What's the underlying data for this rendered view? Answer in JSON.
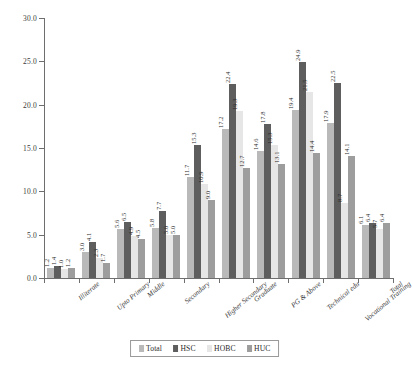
{
  "chart_data": {
    "type": "bar",
    "title": "",
    "xlabel": "",
    "ylabel": "",
    "ylim": [
      0,
      30
    ],
    "ytick_step": 5,
    "grid": false,
    "legend_position": "bottom",
    "yticks": [
      "0.0",
      "5.0",
      "10.0",
      "15.0",
      "20.0",
      "25.0",
      "30.0"
    ],
    "categories": [
      "Illiterate",
      "Upto Primary",
      "Middle",
      "Secondary",
      "Higher Secondary",
      "Graduate",
      "PG & Above",
      "Technical edu",
      "Vocational Training",
      "Total"
    ],
    "series": [
      {
        "name": "Total",
        "color": "#b9b9b9",
        "values": [
          1.2,
          3.0,
          5.6,
          5.8,
          11.7,
          17.2,
          14.6,
          19.4,
          17.9,
          6.1
        ]
      },
      {
        "name": "HSC",
        "color": "#5e5e5e",
        "values": [
          1.4,
          4.1,
          6.5,
          7.7,
          15.3,
          22.4,
          17.8,
          24.9,
          22.5,
          6.4
        ]
      },
      {
        "name": "HOBC",
        "color": "#e6e6e6",
        "values": [
          1.0,
          2.3,
          4.9,
          5.0,
          10.9,
          19.3,
          15.3,
          21.5,
          8.7,
          5.7
        ]
      },
      {
        "name": "HUC",
        "color": "#9d9d9d",
        "values": [
          1.2,
          1.7,
          4.5,
          5.0,
          9.0,
          12.7,
          13.1,
          14.4,
          14.1,
          6.4
        ]
      }
    ]
  },
  "legend": {
    "items": [
      {
        "label": "Total"
      },
      {
        "label": "HSC"
      },
      {
        "label": "HOBC"
      },
      {
        "label": "HUC"
      }
    ]
  }
}
